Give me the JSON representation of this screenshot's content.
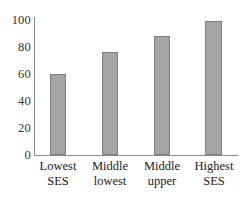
{
  "chart_data": {
    "type": "bar",
    "title": "",
    "xlabel": "",
    "ylabel": "",
    "categories": [
      "Lowest SES",
      "Middle lowest",
      "Middle upper",
      "Highest SES"
    ],
    "category_lines": [
      [
        "Lowest",
        "SES"
      ],
      [
        "Middle",
        "lowest"
      ],
      [
        "Middle",
        "upper"
      ],
      [
        "Highest",
        "SES"
      ]
    ],
    "values": [
      60,
      76,
      88,
      99
    ],
    "ylim": [
      0,
      100
    ],
    "yticks": [
      0,
      20,
      40,
      60,
      80,
      100
    ],
    "ytick_labels": [
      "0",
      "20",
      "40",
      "60",
      "80",
      "100"
    ],
    "grid": false,
    "legend": false,
    "colors": {
      "bar_fill": "#a6a6a6",
      "bar_edge": "#7d7d7d",
      "axis": "#8a8a8a",
      "text": "#333333",
      "background": "#ffffff"
    }
  }
}
